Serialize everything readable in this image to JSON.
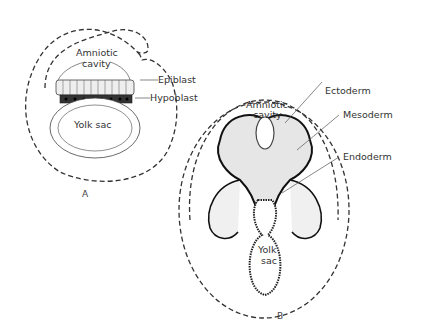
{
  "figure": {
    "panel_a": {
      "letter": "A",
      "labels": {
        "amniotic_cavity_line1": "Amniotic",
        "amniotic_cavity_line2": "cavity",
        "epiblast": "Epiblast",
        "hypoblast": "Hypoblast",
        "yolk_sac": "Yolk sac"
      }
    },
    "panel_b": {
      "letter": "B",
      "labels": {
        "amniotic_cavity_line1": "Amniotic",
        "amniotic_cavity_line2": "cavity",
        "ectoderm": "Ectoderm",
        "mesoderm": "Mesoderm",
        "endoderm": "Endoderm",
        "yolk_sac_line1": "Yolk",
        "yolk_sac_line2": "sac"
      }
    },
    "caption_partial": "Fig. 5-5. Transformation of the bilaminar embryonic disc..."
  }
}
